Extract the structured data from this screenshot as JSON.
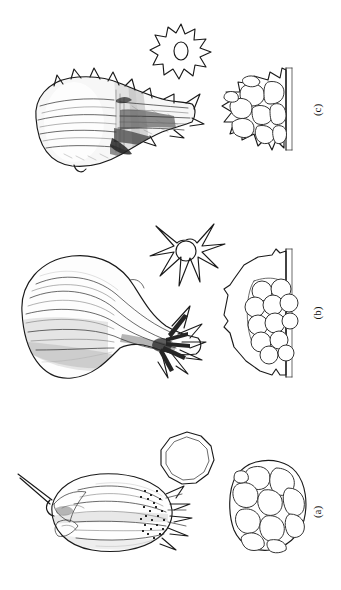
{
  "plate": {
    "title": "Botanical illustration plate",
    "background_color": "#ffffff",
    "ink_color": "#1a1a1a",
    "width": 341,
    "height": 590,
    "panel_count": 3
  },
  "panels": [
    {
      "id": "c",
      "label": "(c)",
      "label_rotation_deg": -90,
      "figures": [
        {
          "name": "lateral-habit-view",
          "description": "Bulbous ribbed fruit in lateral view with tapering spiny neck, dense cross-hatch shading"
        },
        {
          "name": "apical-star-view",
          "description": "Cog-like star outline with nine short triangular spines and a central oval aperture",
          "ray_count": 9,
          "aperture_shape": "oval"
        },
        {
          "name": "cellular-cross-section",
          "description": "Spiny-walled cellular cross-section truncated by a straight vertical cut edge on the right",
          "cell_count": 10,
          "spine_count": 9,
          "cut_edge": "right"
        }
      ]
    },
    {
      "id": "b",
      "label": "(b)",
      "label_rotation_deg": -90,
      "figures": [
        {
          "name": "lateral-habit-view",
          "description": "Pear or gourd shaped fruit with longitudinal ribs and radiating dark spines at the narrow end"
        },
        {
          "name": "apical-star-view",
          "description": "Star outline with eight long slender rays around a circular central aperture",
          "ray_count": 8,
          "aperture_shape": "circle"
        },
        {
          "name": "cellular-cross-section",
          "description": "Large oval wall with small marginal bumps enclosing a cluster of rounded cells offset to the right, truncated by a vertical cut edge",
          "cell_count": 12,
          "bump_count": 8,
          "cut_edge": "right"
        }
      ]
    },
    {
      "id": "a",
      "label": "(a)",
      "label_rotation_deg": -90,
      "figures": [
        {
          "name": "lateral-habit-view",
          "description": "Elongated ovoid fruit with a slender stalk at the left and fringed bristly appendages at the right"
        },
        {
          "name": "apical-polygon-view",
          "description": "Rounded nine-sided polygon drawn with a double outline",
          "side_count": 9,
          "outline": "double"
        },
        {
          "name": "cellular-cross-section",
          "description": "Compact rounded cluster of polygonal cells without external spines",
          "cell_count": 11,
          "cut_edge": "none"
        }
      ]
    }
  ]
}
